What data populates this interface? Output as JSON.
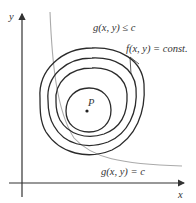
{
  "diagram": {
    "title": "",
    "axes": {
      "x_label": "x",
      "y_label": "y"
    },
    "labels": {
      "constraint_region": "g(x, y) ≤ c",
      "level_curves": "f(x, y) = const.",
      "constraint_curve": "g(x, y) = c",
      "point": "P"
    },
    "colors": {
      "axes": "#333333",
      "contours": "#2b2b2b",
      "constraint_curve": "#aaaaaa",
      "text": "#333333"
    },
    "contour_count": 4
  }
}
